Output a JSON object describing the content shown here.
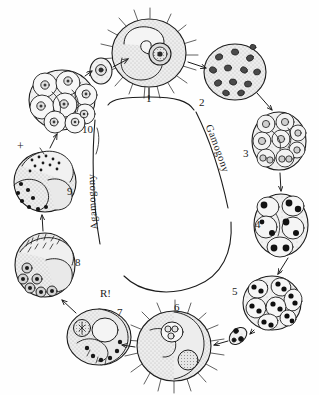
{
  "figure": {
    "background_color": "#ffffff",
    "ink_color": "#1c1c1c",
    "cytoplasm_fill": "#e8e8e8",
    "nucleus_fill": "#1c1c1c"
  },
  "phase_labels": {
    "gamogony": "Gamogony",
    "agamogony": "Agamogony"
  },
  "annotations": {
    "reduction_division": "R!",
    "plus_sign": "+"
  },
  "stages": [
    {
      "number": "1",
      "label_x": 146,
      "label_y": 93,
      "name": "flagellated-gamont",
      "description": "Large spiny uninucleate cell with prominent nucleus"
    },
    {
      "number": "2",
      "label_x": 199,
      "label_y": 97,
      "name": "multinucleate-cell",
      "description": "Round multinucleate cell with many dark nuclei"
    },
    {
      "number": "3",
      "label_x": 243,
      "label_y": 148,
      "name": "segmented-cell-cluster",
      "description": "Cell divided into daughter cells each with ring nuclei"
    },
    {
      "number": "4",
      "label_x": 255,
      "label_y": 219,
      "name": "dark-nuclei-cluster",
      "description": "Cluster of daughter cells with solid dark nuclei"
    },
    {
      "number": "5",
      "label_x": 232,
      "label_y": 286,
      "name": "spore-mother-cluster",
      "description": "Aggregate of spore-forming cells with paired dark nuclei"
    },
    {
      "number": "6",
      "label_x": 174,
      "label_y": 302,
      "name": "spiny-zygote",
      "description": "Large spiny cell containing inclusion bodies"
    },
    {
      "number": "7",
      "label_x": 117,
      "label_y": 307,
      "name": "reduction-stage-cell",
      "description": "Cell undergoing reduction division, marked R!"
    },
    {
      "number": "8",
      "label_x": 75,
      "label_y": 257,
      "name": "granular-cell",
      "description": "Cell with granular contents and ringed nuclei"
    },
    {
      "number": "9",
      "label_x": 67,
      "label_y": 186,
      "name": "stippled-cell",
      "description": "Cell with stippled lobes marked with plus sign"
    },
    {
      "number": "10",
      "label_x": 82,
      "label_y": 124,
      "name": "rosette-cluster",
      "description": "Rosette of daughter cells with ring nuclei"
    }
  ],
  "free_cells": [
    {
      "name": "small-released-cell",
      "cx": 100,
      "cy": 70
    },
    {
      "name": "small-spore",
      "cx": 238,
      "cy": 335
    }
  ]
}
